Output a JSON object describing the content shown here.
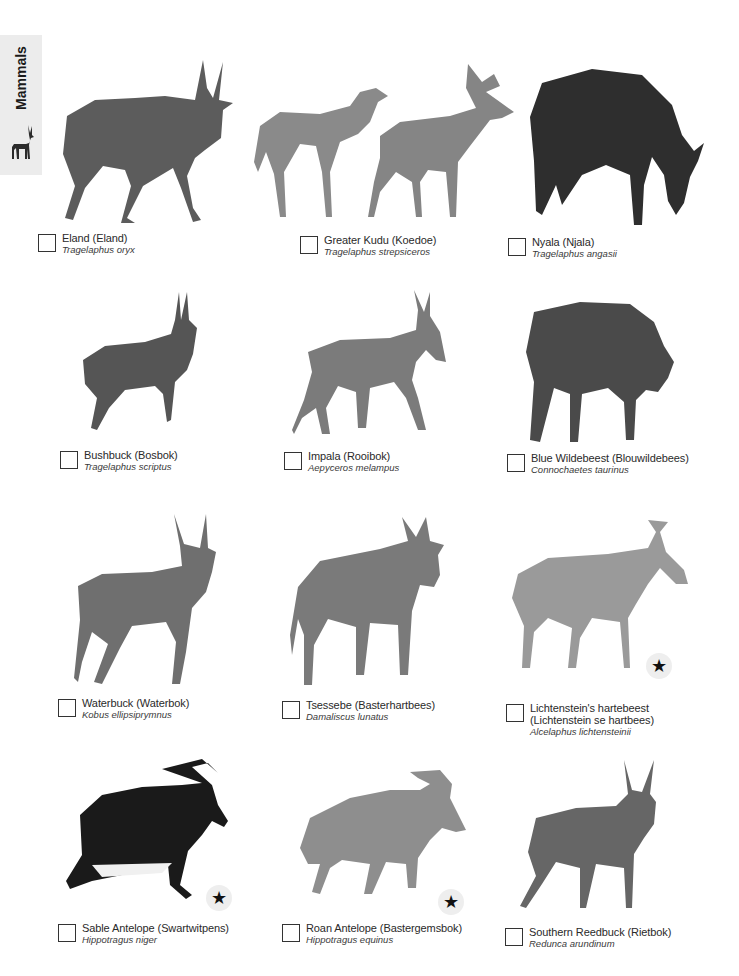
{
  "section_tab": {
    "label": "Mammals",
    "icon": "antelope-silhouette-icon"
  },
  "colors": {
    "tab_background": "#ececec",
    "text": "#2a2a2a",
    "star_badge_background": "#eeeeee"
  },
  "entries": [
    {
      "common": "Eland (Eland)",
      "scientific": "Tragelaphus oryx",
      "protected_star": false
    },
    {
      "common": "Greater Kudu (Koedoe)",
      "scientific": "Tragelaphus strepsiceros",
      "protected_star": false
    },
    {
      "common": "Nyala (Njala)",
      "scientific": "Tragelaphus angasii",
      "protected_star": false
    },
    {
      "common": "Bushbuck (Bosbok)",
      "scientific": "Tragelaphus scriptus",
      "protected_star": false
    },
    {
      "common": "Impala (Rooibok)",
      "scientific": "Aepyceros melampus",
      "protected_star": false
    },
    {
      "common": "Blue Wildebeest (Blouwildebees)",
      "scientific": "Connochaetes taurinus",
      "protected_star": false
    },
    {
      "common": "Waterbuck (Waterbok)",
      "scientific": "Kobus ellipsiprymnus",
      "protected_star": false
    },
    {
      "common": "Tsessebe (Basterhartbees)",
      "scientific": "Damaliscus lunatus",
      "protected_star": false
    },
    {
      "common": "Lichtenstein's hartebeest",
      "common_line2": "(Lichtenstein se hartbees)",
      "scientific": "Alcelaphus lichtensteinii",
      "protected_star": true
    },
    {
      "common": "Sable Antelope (Swartwitpens)",
      "scientific": "Hippotragus niger",
      "protected_star": true
    },
    {
      "common": "Roan Antelope (Bastergemsbok)",
      "scientific": "Hippotragus equinus",
      "protected_star": true
    },
    {
      "common": "Southern Reedbuck (Rietbok)",
      "scientific": "Redunca arundinum",
      "protected_star": false
    }
  ],
  "star_glyph": "★"
}
